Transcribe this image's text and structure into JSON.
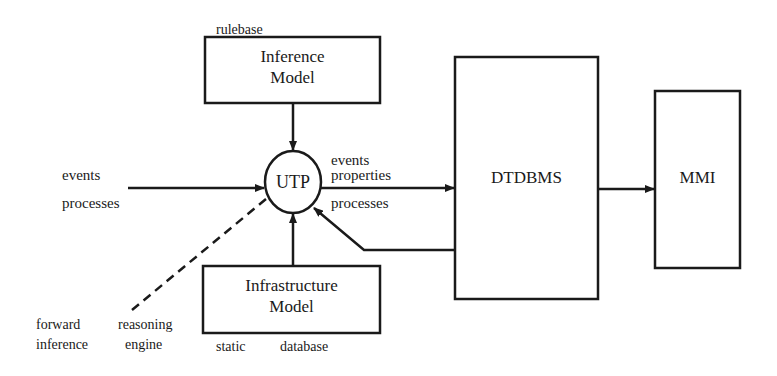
{
  "diagram": {
    "nodes": {
      "inference_model": {
        "title_line1": "Inference",
        "title_line2": "Model",
        "annotation": "rulebase"
      },
      "utp": {
        "label": "UTP"
      },
      "infrastructure_model": {
        "title_line1": "Infrastructure",
        "title_line2": "Model",
        "annotation_left": "static",
        "annotation_right": "database"
      },
      "dtdbms": {
        "label": "DTDBMS"
      },
      "mmi": {
        "label": "MMI"
      }
    },
    "edge_labels": {
      "input_events": "events",
      "input_processes": "processes",
      "output_events": "events",
      "output_properties": "properties",
      "output_processes": "processes",
      "forward_inference_line1": "forward",
      "forward_inference_line2": "inference",
      "reasoning_engine_line1": "reasoning",
      "reasoning_engine_line2": "engine"
    },
    "colors": {
      "stroke": "#1a1a1a",
      "background": "#ffffff"
    }
  }
}
